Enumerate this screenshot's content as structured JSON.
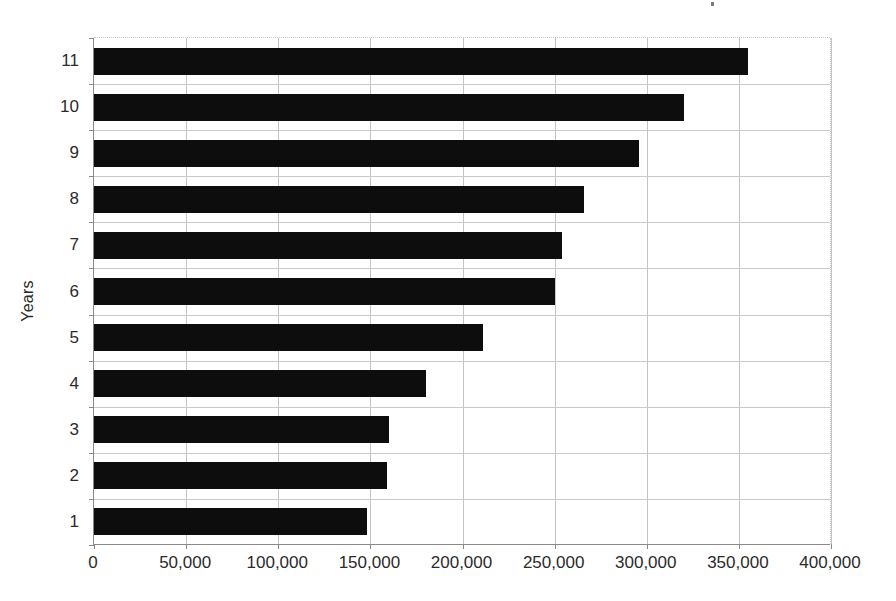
{
  "chart_data": {
    "type": "bar",
    "orientation": "horizontal",
    "title": "",
    "xlabel": "",
    "ylabel": "Years",
    "categories": [
      "1",
      "2",
      "3",
      "4",
      "5",
      "6",
      "7",
      "8",
      "9",
      "10",
      "11"
    ],
    "values": [
      148000,
      159000,
      160000,
      180000,
      211000,
      250000,
      254000,
      266000,
      296000,
      320000,
      355000
    ],
    "xlim": [
      0,
      400000
    ],
    "xticks": [
      0,
      50000,
      100000,
      150000,
      200000,
      250000,
      300000,
      350000,
      400000
    ],
    "xtick_labels": [
      "0",
      "50,000",
      "100,000",
      "150,000",
      "200,000",
      "250,000",
      "300,000",
      "350,000",
      "400,000"
    ],
    "ytick_labels": [
      "1",
      "2",
      "3",
      "4",
      "5",
      "6",
      "7",
      "8",
      "9",
      "10",
      "11"
    ],
    "grid": true,
    "grid_axes": "both",
    "legend": false,
    "legend_position": "none",
    "bar_color": "#0d0d0d",
    "gridline_color": "#c4c4c4",
    "axis_color": "#8a8a8a",
    "background_color": "#ffffff",
    "series": [
      {
        "name": "Years",
        "values": [
          148000,
          159000,
          160000,
          180000,
          211000,
          250000,
          254000,
          266000,
          296000,
          320000,
          355000
        ]
      }
    ]
  },
  "axis": {
    "y_title": "Years"
  }
}
